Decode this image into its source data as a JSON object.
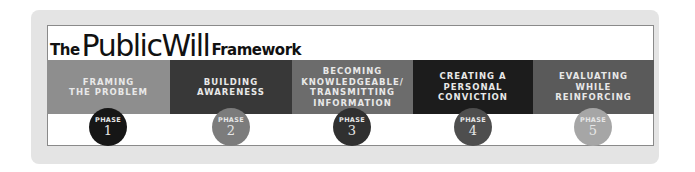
{
  "title": {
    "part1": "The",
    "part2": "PublicWill",
    "part3": "Framework"
  },
  "phases": [
    {
      "label": "FRAMING\nTHE PROBLEM",
      "phase_word": "PHASE",
      "number": "1",
      "band_color": "#8e8e8e",
      "circle_color": "#161616"
    },
    {
      "label": "BUILDING\nAWARENESS",
      "phase_word": "PHASE",
      "number": "2",
      "band_color": "#383838",
      "circle_color": "#7c7c7c"
    },
    {
      "label": "BECOMING\nKNOWLEDGEABLE/\nTRANSMITTING\nINFORMATION",
      "phase_word": "PHASE",
      "number": "3",
      "band_color": "#6c6c6c",
      "circle_color": "#303030"
    },
    {
      "label": "CREATING A\nPERSONAL\nCONVICTION",
      "phase_word": "PHASE",
      "number": "4",
      "band_color": "#1c1c1c",
      "circle_color": "#4e4e4e"
    },
    {
      "label": "EVALUATING\nWHILE\nREINFORCING",
      "phase_word": "PHASE",
      "number": "5",
      "band_color": "#5a5a5a",
      "circle_color": "#a6a6a6"
    }
  ]
}
